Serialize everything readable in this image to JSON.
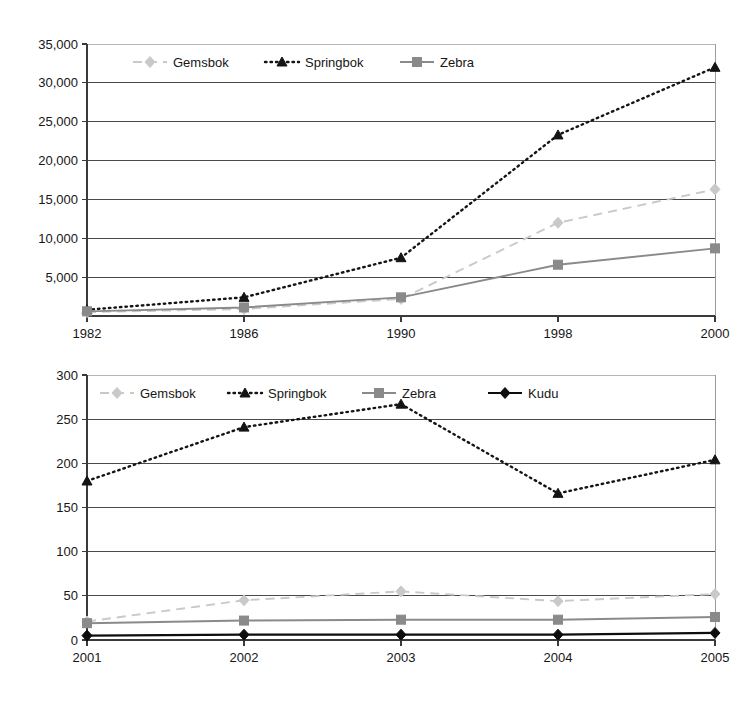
{
  "page": {
    "background_color": "#ffffff"
  },
  "colors": {
    "gemsbok": "#c9c9c9",
    "springbok": "#141414",
    "zebra": "#8a8a8a",
    "kudu": "#0d0d0d",
    "axis": "#3a3a3a",
    "grid": "#4a4a4a",
    "text": "#161616"
  },
  "chart_data": [
    {
      "id": "chart-top",
      "type": "line",
      "title": "",
      "xlabel": "",
      "ylabel": "",
      "categories": [
        "1982",
        "1986",
        "1990",
        "1998",
        "2000"
      ],
      "xtick_labels": [
        "1982",
        "1986",
        "1990",
        "1998",
        "2000"
      ],
      "ytick_labels": [
        "35,000",
        "30,000",
        "25,000",
        "20,000",
        "15,000",
        "10,000",
        "5,000"
      ],
      "ytick_values": [
        35000,
        30000,
        25000,
        20000,
        15000,
        10000,
        5000
      ],
      "ylim": [
        0,
        35000
      ],
      "xlim": [
        0,
        4
      ],
      "grid": true,
      "legend_position": "top-left-inside",
      "series": [
        {
          "name": "Gemsbok",
          "color": "#c9c9c9",
          "marker": "diamond",
          "dash": "dashed",
          "values": [
            500,
            900,
            2200,
            12000,
            16300
          ]
        },
        {
          "name": "Springbok",
          "color": "#141414",
          "marker": "triangle",
          "dash": "dotted",
          "values": [
            800,
            2400,
            7500,
            23300,
            32000
          ]
        },
        {
          "name": "Zebra",
          "color": "#8a8a8a",
          "marker": "square",
          "dash": "solid",
          "values": [
            600,
            1100,
            2400,
            6600,
            8700
          ]
        }
      ]
    },
    {
      "id": "chart-bottom",
      "type": "line",
      "title": "",
      "xlabel": "",
      "ylabel": "",
      "categories": [
        "2001",
        "2002",
        "2003",
        "2004",
        "2005"
      ],
      "xtick_labels": [
        "2001",
        "2002",
        "2003",
        "2004",
        "2005"
      ],
      "ytick_labels": [
        "300",
        "250",
        "200",
        "150",
        "100",
        "50",
        "0"
      ],
      "ytick_values": [
        300,
        250,
        200,
        150,
        100,
        50,
        0
      ],
      "ylim": [
        0,
        300
      ],
      "xlim": [
        0,
        4
      ],
      "grid": true,
      "legend_position": "top-left-inside",
      "series": [
        {
          "name": "Gemsbok",
          "color": "#c9c9c9",
          "marker": "diamond",
          "dash": "dashed",
          "values": [
            21,
            45,
            55,
            44,
            52
          ]
        },
        {
          "name": "Springbok",
          "color": "#141414",
          "marker": "triangle",
          "dash": "dotted",
          "values": [
            180,
            241,
            267,
            166,
            204
          ]
        },
        {
          "name": "Zebra",
          "color": "#8a8a8a",
          "marker": "square",
          "dash": "solid",
          "values": [
            19,
            22,
            23,
            23,
            26
          ]
        },
        {
          "name": "Kudu",
          "color": "#0d0d0d",
          "marker": "diamond",
          "dash": "solid",
          "values": [
            5,
            6,
            6,
            6,
            8
          ]
        }
      ]
    }
  ]
}
